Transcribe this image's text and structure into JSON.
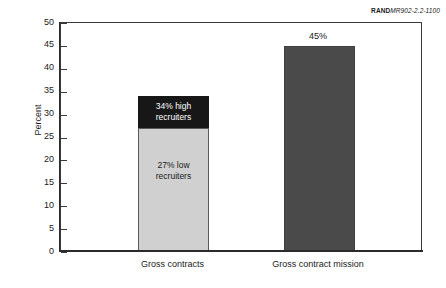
{
  "credit": {
    "org": "RAND",
    "document_id": "MR902-2.2-1100"
  },
  "chart_data": {
    "type": "bar",
    "title": "",
    "xlabel": "",
    "ylabel": "Percent",
    "ylim": [
      0,
      50
    ],
    "ytick_step": 5,
    "yticks": [
      "50",
      "45",
      "40",
      "35",
      "30",
      "25",
      "20",
      "15",
      "10",
      "5",
      "0"
    ],
    "grid": false,
    "legend": false,
    "stacked": true,
    "categories": [
      "Gross contracts",
      "Gross contract mission"
    ],
    "series": [
      {
        "name": "27% low recruiters",
        "color": "#d0d0d0",
        "values": [
          27,
          0
        ]
      },
      {
        "name": "34% high recruiters",
        "color": "#171717",
        "values": [
          7,
          0
        ]
      },
      {
        "name": "Gross contract mission",
        "color": "#4a4a4a",
        "values": [
          0,
          45
        ]
      }
    ],
    "bars": [
      {
        "category": "Gross contracts",
        "total": 34,
        "segments": [
          {
            "label": "27% low recruiters",
            "from": 0,
            "to": 27,
            "color": "#d0d0d0",
            "text_color": "#1a1a1a",
            "line1": "27% low",
            "line2": "recruiters"
          },
          {
            "label": "34% high recruiters",
            "from": 27,
            "to": 34,
            "color": "#171717",
            "text_color": "#ffffff",
            "line1": "34% high",
            "line2": "recruiters"
          }
        ],
        "value_label": ""
      },
      {
        "category": "Gross contract mission",
        "total": 45,
        "segments": [
          {
            "label": "45%",
            "from": 0,
            "to": 45,
            "color": "#4a4a4a",
            "text_color": "#1a1a1a",
            "line1": "",
            "line2": ""
          }
        ],
        "value_label": "45%"
      }
    ],
    "annotations": [
      {
        "text": "34% high recruiters",
        "on": "Gross contracts",
        "position": "inside-top-segment"
      },
      {
        "text": "27% low recruiters",
        "on": "Gross contracts",
        "position": "inside-bottom-segment"
      },
      {
        "text": "45%",
        "on": "Gross contract mission",
        "position": "above-bar"
      }
    ]
  }
}
